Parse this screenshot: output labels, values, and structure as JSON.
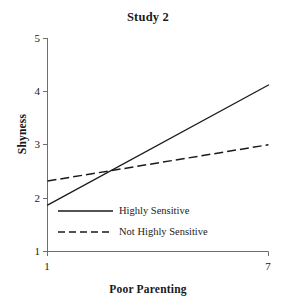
{
  "chart_data": {
    "type": "line",
    "title": "Study 2",
    "xlabel": "Poor Parenting",
    "ylabel": "Shyness",
    "xlim": [
      1,
      7
    ],
    "ylim": [
      1,
      5
    ],
    "xticks": [
      "1",
      "7"
    ],
    "yticks": [
      "5",
      "4",
      "3",
      "2",
      "1"
    ],
    "grid": false,
    "legend_position": "inside-lower-center",
    "x": [
      1,
      7
    ],
    "series": [
      {
        "name": "Highly Sensitive",
        "style": "solid",
        "color": "#1a1a1a",
        "values": [
          1.87,
          4.12
        ]
      },
      {
        "name": "Not Highly Sensitive",
        "style": "dashed",
        "color": "#1a1a1a",
        "values": [
          2.32,
          3.0
        ]
      }
    ]
  },
  "axis": {
    "y_tick_5": "5",
    "y_tick_4": "4",
    "y_tick_3": "3",
    "y_tick_2": "2",
    "y_tick_1": "1",
    "x_tick_left": "1",
    "x_tick_right": "7"
  },
  "legend": {
    "item_solid_label": "Highly Sensitive",
    "item_dashed_label": "Not Highly Sensitive"
  },
  "colors": {
    "line": "#1a1a1a",
    "axis": "#6e6e6e",
    "text": "#1a1a1a",
    "background": "#ffffff"
  }
}
